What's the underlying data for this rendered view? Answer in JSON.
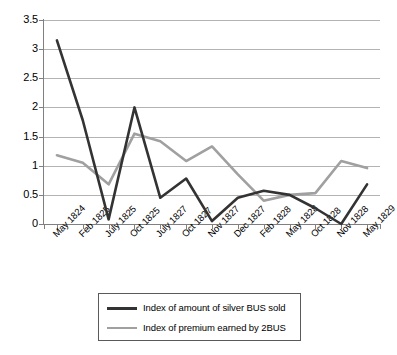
{
  "chart_data": {
    "type": "line",
    "title": "",
    "xlabel": "",
    "ylabel": "",
    "ylim": [
      0,
      3.5
    ],
    "ytick_values": [
      0,
      0.5,
      1,
      1.5,
      2,
      2.5,
      3,
      3.5
    ],
    "ytick_labels": [
      "0",
      "0.5",
      "1",
      "1.5",
      "2",
      "2.5",
      "3",
      "3.5"
    ],
    "grid": true,
    "legend_position": "bottom",
    "categories": [
      "May 1824",
      "Feb 1825",
      "July 1825",
      "Oct 1825",
      "July 1827",
      "Oct 1827",
      "Nov 1827",
      "Dec 1827",
      "Feb 1828",
      "May 1828",
      "Oct 1828",
      "Nov 1828",
      "May 1829"
    ],
    "series": [
      {
        "name": "Index of amount of silver BUS sold",
        "color": "#333333",
        "values": [
          3.15,
          1.78,
          0.08,
          2.0,
          0.45,
          0.78,
          0.05,
          0.45,
          0.57,
          0.5,
          0.27,
          0.0,
          0.68
        ]
      },
      {
        "name": "Index of premium earned by 2BUS",
        "color": "#a0a0a0",
        "values": [
          1.18,
          1.05,
          0.68,
          1.55,
          1.42,
          1.08,
          1.33,
          0.85,
          0.4,
          0.5,
          0.53,
          1.08,
          0.96
        ]
      }
    ]
  },
  "legend": {
    "entries": [
      {
        "label": "Index of amount of silver BUS sold",
        "color": "#333333"
      },
      {
        "label": "Index of premium earned by 2BUS",
        "color": "#a0a0a0"
      }
    ]
  }
}
